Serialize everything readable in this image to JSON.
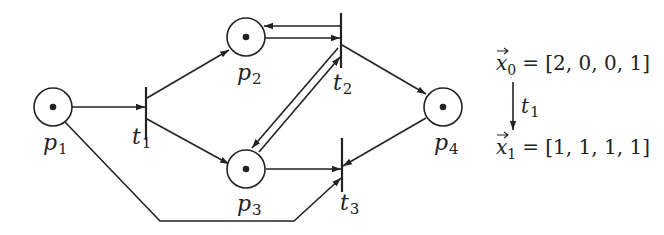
{
  "diagram": {
    "places": [
      {
        "id": "p1",
        "label": "p",
        "sub": "1",
        "tokens": 1
      },
      {
        "id": "p2",
        "label": "p",
        "sub": "2",
        "tokens": 1
      },
      {
        "id": "p3",
        "label": "p",
        "sub": "3",
        "tokens": 1
      },
      {
        "id": "p4",
        "label": "p",
        "sub": "4",
        "tokens": 1
      }
    ],
    "transitions": [
      {
        "id": "t1",
        "label": "t",
        "sub": "1"
      },
      {
        "id": "t2",
        "label": "t",
        "sub": "2"
      },
      {
        "id": "t3",
        "label": "t",
        "sub": "3"
      }
    ],
    "arcs": [
      {
        "from": "p1",
        "to": "t1"
      },
      {
        "from": "t1",
        "to": "p2"
      },
      {
        "from": "t1",
        "to": "p3"
      },
      {
        "from": "p2",
        "to": "t2"
      },
      {
        "from": "t2",
        "to": "p2"
      },
      {
        "from": "p3",
        "to": "t2"
      },
      {
        "from": "t2",
        "to": "p3"
      },
      {
        "from": "t2",
        "to": "p4"
      },
      {
        "from": "p3",
        "to": "t3"
      },
      {
        "from": "p4",
        "to": "t3"
      },
      {
        "from": "p1",
        "to": "t3"
      }
    ],
    "state_equation": {
      "x0_label": "x",
      "x0_sub": "0",
      "x0_value": "= [2, 0, 0, 1]",
      "arrow_label": "t",
      "arrow_sub": "1",
      "x1_label": "x",
      "x1_sub": "1",
      "x1_value": "= [1, 1, 1, 1]"
    }
  }
}
